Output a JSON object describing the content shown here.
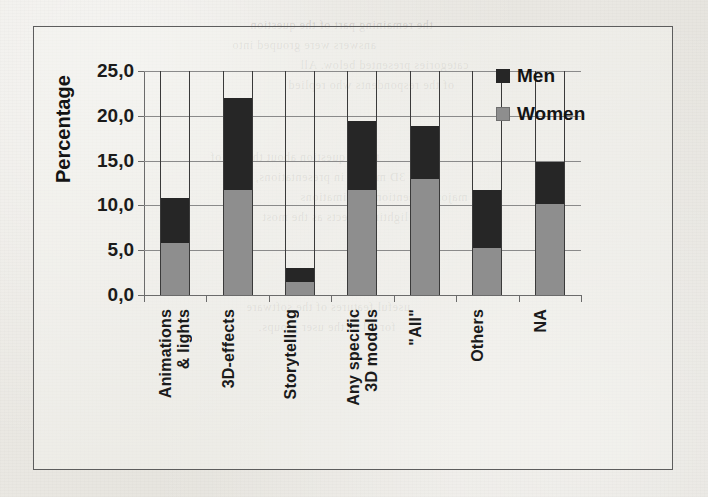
{
  "page": {
    "bleed_text": [
      "the remaining part of the question",
      "answers were grouped into",
      "categories presented below. All",
      "of the respondents who replied",
      "to the question about the use of",
      "3D models in presentations, the",
      "majority mentioned animations",
      "and lighting effects as the most",
      "useful features of the software",
      "for all of the user groups."
    ]
  },
  "chart_data": {
    "type": "bar",
    "subtype": "stacked-vertical",
    "title": "",
    "xlabel": "",
    "ylabel": "Percentage",
    "ylim": [
      0,
      25
    ],
    "ytick_labels": [
      "0,0",
      "5,0",
      "10,0",
      "15,0",
      "20,0",
      "25,0"
    ],
    "ytick_values": [
      0,
      5,
      10,
      15,
      20,
      25
    ],
    "grid": true,
    "legend_position": "top-right",
    "decimal_separator": ",",
    "categories": [
      "Animations\n& lights",
      "3D-effects",
      "Storytelling",
      "Any specific\n3D models",
      "\"All\"",
      "Others",
      "NA"
    ],
    "series": [
      {
        "name": "Women",
        "color": "#8e8e8e",
        "values": [
          5.8,
          11.7,
          1.5,
          11.7,
          12.9,
          5.2,
          10.2
        ]
      },
      {
        "name": "Men",
        "color": "#262626",
        "values": [
          5.0,
          10.3,
          1.5,
          7.7,
          6.0,
          6.5,
          4.7
        ]
      }
    ],
    "totals": [
      10.8,
      22.0,
      3.0,
      19.4,
      18.9,
      11.7,
      14.9
    ]
  }
}
